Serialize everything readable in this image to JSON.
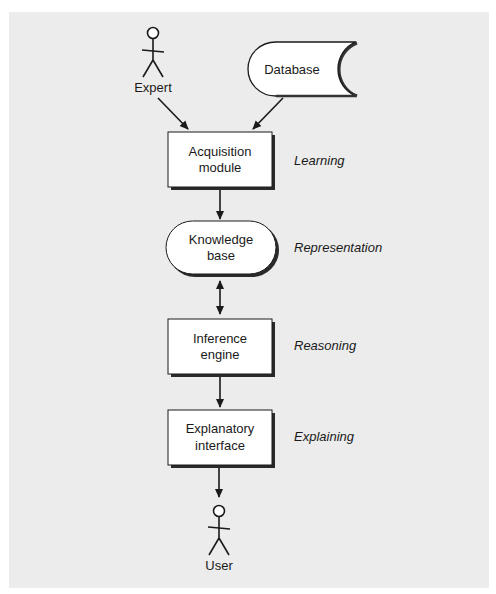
{
  "diagram": {
    "colors": {
      "panel_background": "#ececec",
      "node_fill": "#ffffff",
      "stroke": "#1a1a1a",
      "shadow": "#333333"
    },
    "actors": {
      "expert": {
        "label": "Expert"
      },
      "user": {
        "label": "User"
      }
    },
    "nodes": {
      "database": {
        "label": "Database",
        "shape": "stored-data"
      },
      "acquisition": {
        "line1": "Acquisition",
        "line2": "module",
        "shape": "rectangle"
      },
      "knowledge": {
        "line1": "Knowledge",
        "line2": "base",
        "shape": "rounded-pill"
      },
      "inference": {
        "line1": "Inference",
        "line2": "engine",
        "shape": "rectangle"
      },
      "explanatory": {
        "line1": "Explanatory",
        "line2": "interface",
        "shape": "rectangle"
      }
    },
    "roles": {
      "learning": "Learning",
      "representation": "Representation",
      "reasoning": "Reasoning",
      "explaining": "Explaining"
    },
    "edges": [
      {
        "from": "Expert",
        "to": "Acquisition module",
        "direction": "forward"
      },
      {
        "from": "Database",
        "to": "Acquisition module",
        "direction": "forward"
      },
      {
        "from": "Acquisition module",
        "to": "Knowledge base",
        "direction": "forward"
      },
      {
        "from": "Knowledge base",
        "to": "Inference engine",
        "direction": "bidirectional"
      },
      {
        "from": "Inference engine",
        "to": "Explanatory interface",
        "direction": "forward"
      },
      {
        "from": "Explanatory interface",
        "to": "User",
        "direction": "forward"
      }
    ]
  }
}
